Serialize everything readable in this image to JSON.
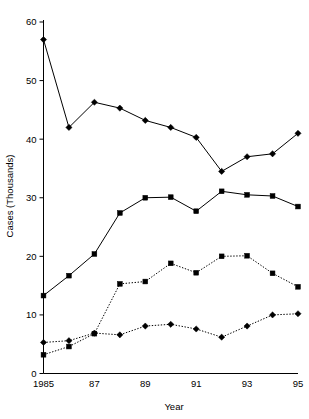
{
  "chart_data": {
    "type": "line",
    "title": "",
    "xlabel": "Year",
    "ylabel": "Cases (Thousands)",
    "x": [
      1985,
      1986,
      1987,
      1988,
      1989,
      1990,
      1991,
      1992,
      1993,
      1994,
      1995
    ],
    "xtick_values": [
      1985,
      1987,
      1989,
      1991,
      1993,
      1995
    ],
    "xtick_labels": [
      "1985",
      "87",
      "89",
      "91",
      "93",
      "95"
    ],
    "ytick_values": [
      0,
      10,
      20,
      30,
      40,
      50,
      60
    ],
    "ytick_labels": [
      "0",
      "10",
      "20",
      "30",
      "40",
      "50",
      "60"
    ],
    "xlim": [
      1985,
      1995
    ],
    "ylim": [
      0,
      60
    ],
    "grid": false,
    "legend": false,
    "legend_position": "none",
    "series": [
      {
        "name": "series-1",
        "marker": "diamond",
        "linestyle": "solid",
        "color": "#000000",
        "values": [
          57.0,
          42.0,
          46.3,
          45.3,
          43.2,
          42.0,
          40.3,
          34.5,
          37.0,
          37.5,
          41.0
        ]
      },
      {
        "name": "series-2",
        "marker": "square",
        "linestyle": "solid",
        "color": "#000000",
        "values": [
          13.3,
          16.7,
          20.4,
          27.4,
          30.0,
          30.1,
          27.7,
          31.1,
          30.5,
          30.3,
          28.5
        ]
      },
      {
        "name": "series-3",
        "marker": "square",
        "linestyle": "dotted",
        "color": "#000000",
        "values": [
          3.2,
          4.6,
          6.8,
          15.3,
          15.7,
          18.8,
          17.2,
          20.0,
          20.1,
          17.1,
          14.8
        ]
      },
      {
        "name": "series-4",
        "marker": "diamond",
        "linestyle": "dotted",
        "color": "#000000",
        "values": [
          5.3,
          5.6,
          6.9,
          6.6,
          8.1,
          8.4,
          7.6,
          6.2,
          8.1,
          10.0,
          10.2
        ]
      }
    ]
  },
  "axes": {
    "y_title": "Cases (Thousands)",
    "x_title": "Year"
  }
}
